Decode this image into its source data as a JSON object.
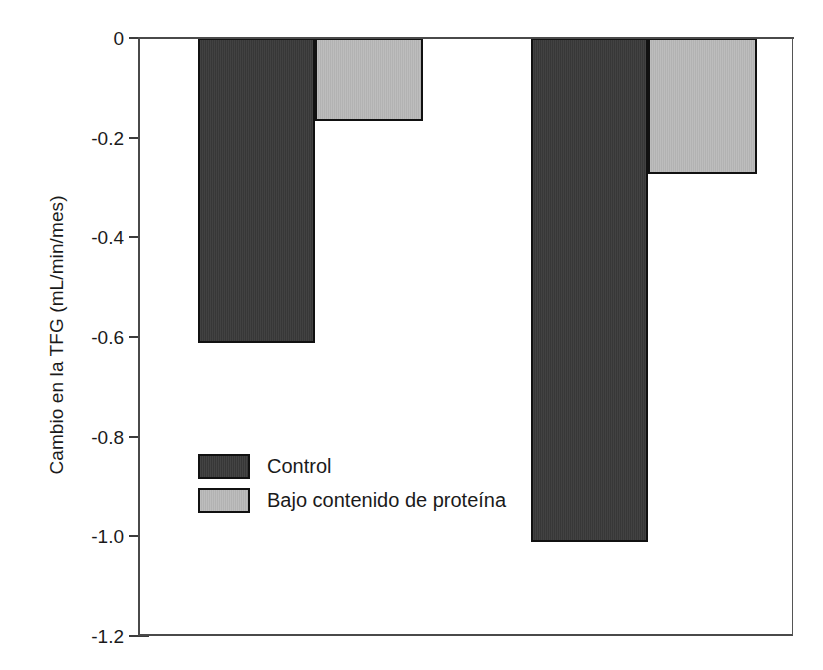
{
  "chart_data": {
    "type": "bar",
    "title": "",
    "subtitle": "",
    "xlabel": "",
    "ylabel": "Cambio en la TFG (mL/min/mes)",
    "categories": [
      "Grupo 1",
      "Grupo 2"
    ],
    "series": [
      {
        "name": "Control",
        "color": "#3a3a3a",
        "values": [
          -0.61,
          -1.01
        ]
      },
      {
        "name": "Bajo contenido de proteína",
        "color": "#b8b8b8",
        "values": [
          -0.165,
          -0.27
        ]
      }
    ],
    "ylim": [
      -1.2,
      0
    ],
    "yticks": [
      0,
      -0.2,
      -0.4,
      -0.6,
      -0.8,
      -1.0,
      -1.2
    ],
    "ytick_labels": [
      "0",
      "-0.2",
      "-0.4",
      "-0.6",
      "-0.8",
      "-1.0",
      "-1.2"
    ],
    "xtick_labels": [],
    "grid": false,
    "legend_position": "inside-lower-left",
    "annotations": []
  },
  "axis": {
    "y_title": "Cambio en la TFG (mL/min/mes)",
    "ticks": [
      {
        "label": "0",
        "value": 0
      },
      {
        "label": "-0.2",
        "value": -0.2
      },
      {
        "label": "-0.4",
        "value": -0.4
      },
      {
        "label": "-0.6",
        "value": -0.6
      },
      {
        "label": "-0.8",
        "value": -0.8
      },
      {
        "label": "-1.0",
        "value": -1.0
      },
      {
        "label": "-1.2",
        "value": -1.2
      }
    ]
  },
  "legend": {
    "items": [
      {
        "label": "Control",
        "color": "#3a3a3a"
      },
      {
        "label": "Bajo contenido de proteína",
        "color": "#b8b8b8"
      }
    ]
  },
  "bars": [
    {
      "name": "bar-group1-control",
      "series": "Control",
      "value": -0.61,
      "x": 198,
      "width": 117
    },
    {
      "name": "bar-group1-lowprotein",
      "series": "Bajo contenido de proteína",
      "value": -0.165,
      "x": 315,
      "width": 108
    },
    {
      "name": "bar-group2-control",
      "series": "Control",
      "value": -1.01,
      "x": 531,
      "width": 117
    },
    {
      "name": "bar-group2-lowprotein",
      "series": "Bajo contenido de proteína",
      "value": -0.27,
      "x": 648,
      "width": 109
    }
  ],
  "colors": {
    "control": "#3a3a3a",
    "low_protein": "#b8b8b8",
    "axis": "#4a4a4a",
    "text": "#1a1a1a",
    "background": "#ffffff"
  }
}
